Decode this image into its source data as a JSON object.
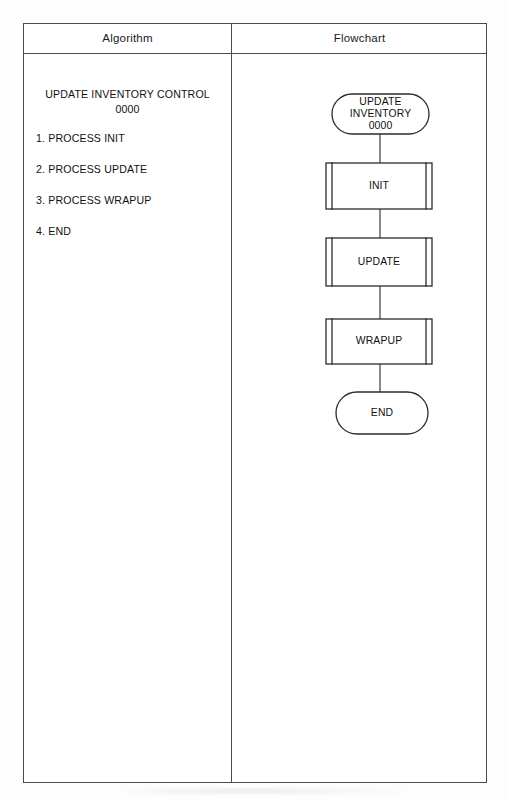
{
  "table": {
    "headers": {
      "algorithm": "Algorithm",
      "flowchart": "Flowchart"
    }
  },
  "algorithm": {
    "title": "UPDATE INVENTORY CONTROL\n0000",
    "steps": [
      "1. PROCESS INIT",
      "2. PROCESS UPDATE",
      "3. PROCESS WRAPUP",
      "4. END"
    ]
  },
  "flowchart": {
    "type": "flowchart",
    "orientation": "top-to-bottom",
    "nodes": [
      {
        "id": "start",
        "shape": "terminator",
        "label": "UPDATE\nINVENTORY\n0000"
      },
      {
        "id": "init",
        "shape": "predefined-process",
        "label": "INIT"
      },
      {
        "id": "update",
        "shape": "predefined-process",
        "label": "UPDATE"
      },
      {
        "id": "wrapup",
        "shape": "predefined-process",
        "label": "WRAPUP"
      },
      {
        "id": "end",
        "shape": "terminator",
        "label": "END"
      }
    ],
    "edges": [
      {
        "from": "start",
        "to": "init"
      },
      {
        "from": "init",
        "to": "update"
      },
      {
        "from": "update",
        "to": "wrapup"
      },
      {
        "from": "wrapup",
        "to": "end"
      }
    ]
  },
  "colors": {
    "stroke": "#2b2b2b",
    "table_border": "#4b4b4b",
    "text": "#111111",
    "background": "#ffffff"
  }
}
